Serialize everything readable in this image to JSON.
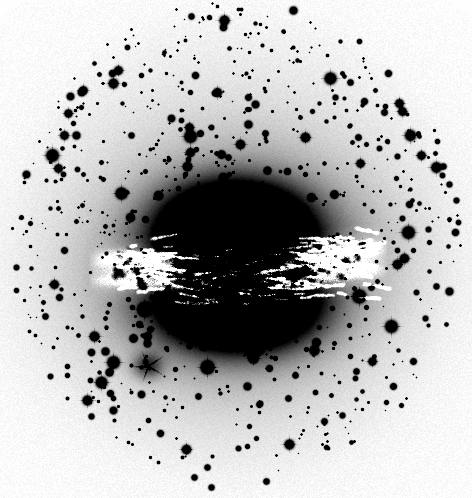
{
  "image": {
    "kind": "astronomical-photographic-plate",
    "rendering": "negative-inverted-grayscale",
    "width": 472,
    "height": 498,
    "background_color": "#ffffff",
    "ink_color": "#000000",
    "caption": "",
    "alt_text": "Negative grayscale photographic plate of a peculiar lenticular galaxy with a broad dark dust lane crossing its bright elliptical bulge, surrounded by a dense field of point-like stars inside a circular plate vignette."
  },
  "field": {
    "label": "plate-field-of-view",
    "shape": "ellipse",
    "center_x": 236,
    "center_y": 242,
    "radius_x": 228,
    "radius_y": 248,
    "edge_softness": 26,
    "halo_peak_gray": "#efefef",
    "corner_gray": "#ffffff"
  },
  "galaxy": {
    "name_label": "",
    "center_x": 236,
    "center_y": 266,
    "outer_halo": {
      "label": "diffuse-outer-halo",
      "radius_x": 190,
      "radius_y": 178,
      "peak_gray": "#d8d8d8"
    },
    "mid_halo": {
      "label": "mid-halo",
      "radius_x": 132,
      "radius_y": 118,
      "peak_gray": "#9a9a9a"
    },
    "bulge": {
      "label": "central-bulge",
      "radius_x": 104,
      "radius_y": 76,
      "peak_gray": "#000000"
    },
    "bulge_upper_lobe": {
      "label": "upper-bulge-lobe",
      "center_x": 233,
      "center_y": 221,
      "radius_x": 86,
      "radius_y": 50
    },
    "bulge_lower_lobe": {
      "label": "lower-bulge-lobe",
      "center_x": 238,
      "center_y": 312,
      "radius_x": 92,
      "radius_y": 48
    },
    "dust_lane": {
      "label": "equatorial-dust-lane",
      "x_start": 104,
      "x_end": 372,
      "y_center": 269,
      "thickness": 42,
      "tilt_degrees": -3,
      "clumpiness": "high",
      "bright_gray": "#ffffff"
    }
  },
  "companion": {
    "label": "diffuse-companion-object",
    "center_x": 148,
    "center_y": 366,
    "radius": 17,
    "peak_gray": "#7a7a7a"
  },
  "starfield": {
    "label": "foreground-and-cluster-star-field",
    "approx_count": 860,
    "size_range_px": [
      1,
      7
    ],
    "concentration": "centrally-peaked",
    "color": "#000000"
  },
  "annotations": {
    "has_text_labels": false,
    "has_axes": false,
    "has_scale_bar": false,
    "has_compass": false,
    "has_border": false
  }
}
